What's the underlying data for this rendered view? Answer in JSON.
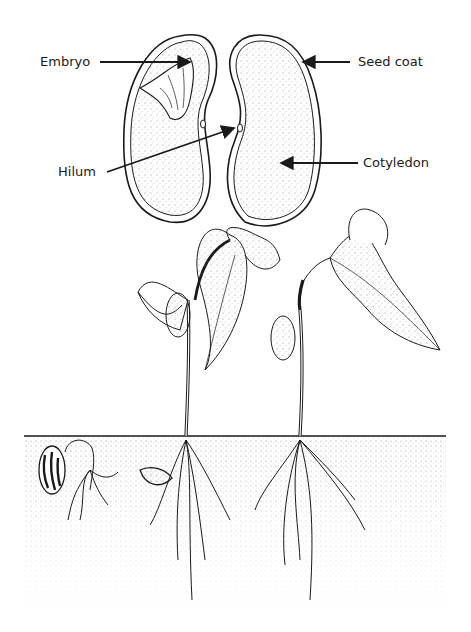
{
  "diagram": {
    "seed_labels": {
      "embryo": "Embryo",
      "seed_coat": "Seed coat",
      "hilum": "Hilum",
      "cotyledon": "Cotyledon"
    },
    "stages": [
      {
        "name": "germinating-seed"
      },
      {
        "name": "seedling-emerging"
      },
      {
        "name": "young-plant-1"
      },
      {
        "name": "young-plant-2"
      }
    ],
    "colors": {
      "ink": "#1a1a1a",
      "soil_stipple": "#9a9a9a",
      "background": "#ffffff"
    }
  }
}
